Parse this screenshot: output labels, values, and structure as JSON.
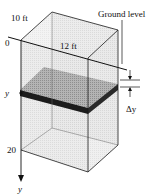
{
  "diagram": {
    "labels": {
      "width_top": "10 ft",
      "length_front": "12 ft",
      "ground_level": "Ground level",
      "origin": "0",
      "depth_marker": "y",
      "bottom_depth": "20",
      "axis_label": "y",
      "slab_thickness": "Δy"
    },
    "colors": {
      "line": "#1a1a1a",
      "box_face": "#e4e4e4",
      "box_face_light": "#f0f0f0",
      "slab_top": "#a8a8a8",
      "slab_edge": "#1c1c1c",
      "background": "#ffffff"
    }
  }
}
